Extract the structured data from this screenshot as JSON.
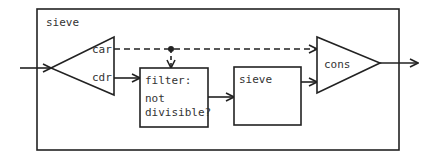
{
  "diagram": {
    "outer_box": {
      "label": "sieve"
    },
    "split_node": {
      "outputs": {
        "top": "car",
        "bottom": "cdr"
      }
    },
    "filter_box": {
      "lines": [
        "filter:",
        "not",
        "divisible?"
      ]
    },
    "inner_sieve_box": {
      "label": "sieve"
    },
    "cons_node": {
      "label": "cons"
    },
    "edges": [
      {
        "from": "input",
        "to": "split_node",
        "style": "solid"
      },
      {
        "from": "split_node.car",
        "to": "cons_node",
        "style": "dashed"
      },
      {
        "from": "split_node.car",
        "to": "filter_box",
        "style": "dashed",
        "via": "junction-dot"
      },
      {
        "from": "split_node.cdr",
        "to": "filter_box",
        "style": "solid"
      },
      {
        "from": "filter_box",
        "to": "inner_sieve_box",
        "style": "solid"
      },
      {
        "from": "inner_sieve_box",
        "to": "cons_node",
        "style": "solid"
      },
      {
        "from": "cons_node",
        "to": "output",
        "style": "solid"
      }
    ],
    "colors": {
      "line": "#222222",
      "text": "#333333",
      "background": "#ffffff"
    }
  }
}
